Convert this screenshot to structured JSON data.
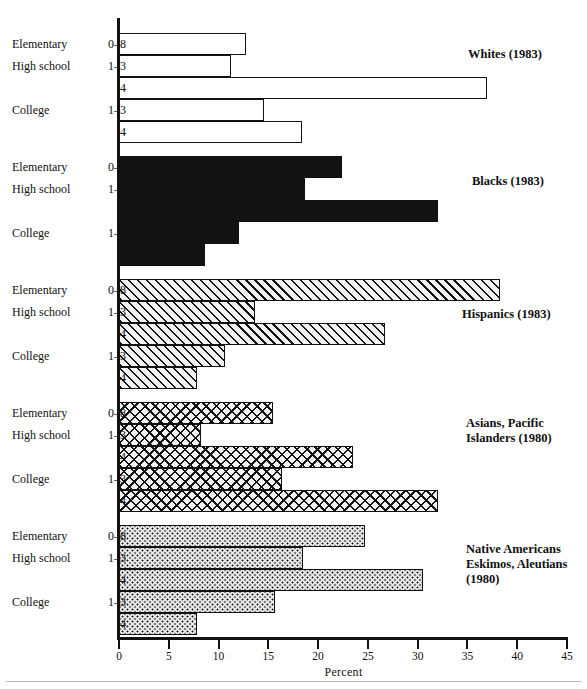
{
  "chart_data": {
    "type": "bar",
    "orientation": "horizontal",
    "title": "",
    "xlabel": "Percent",
    "ylabel": "",
    "xlim": [
      0,
      45
    ],
    "xticks": [
      0,
      5,
      10,
      15,
      20,
      25,
      30,
      35,
      40,
      45
    ],
    "xtick_labels": [
      "0",
      "5",
      "10",
      "15",
      "20",
      "25",
      "30",
      "35",
      "40",
      "45"
    ],
    "grid": false,
    "legend_position": "inside-right",
    "categories": [
      {
        "level": "Elementary",
        "years": "0–8"
      },
      {
        "level": "High school",
        "years": "1–3"
      },
      {
        "level": "",
        "years": "4"
      },
      {
        "level": "College",
        "years": "1–3"
      },
      {
        "level": "",
        "years": "4"
      }
    ],
    "series": [
      {
        "name": "Whites (1983)",
        "caption_lines": [
          "Whites (1983)"
        ],
        "fill": "open",
        "values": [
          12.8,
          11.2,
          37.0,
          14.6,
          18.4
        ]
      },
      {
        "name": "Blacks (1983)",
        "caption_lines": [
          "Blacks (1983)"
        ],
        "fill": "solid",
        "values": [
          22.4,
          18.7,
          32.0,
          12.1,
          8.6
        ]
      },
      {
        "name": "Hispanics (1983)",
        "caption_lines": [
          "Hispanics (1983)"
        ],
        "fill": "hatch",
        "values": [
          38.3,
          13.7,
          26.7,
          10.6,
          7.8
        ]
      },
      {
        "name": "Asians, Pacific Islanders (1980)",
        "caption_lines": [
          "Asians, Pacific",
          "Islanders (1980)"
        ],
        "fill": "cross",
        "values": [
          15.5,
          8.2,
          23.5,
          16.4,
          32.0
        ]
      },
      {
        "name": "Native Americans Eskimos, Aleutians (1980)",
        "caption_lines": [
          "Native Americans",
          "Eskimos, Aleutians",
          "(1980)"
        ],
        "fill": "dots",
        "values": [
          24.7,
          18.5,
          30.5,
          15.7,
          7.8
        ]
      }
    ],
    "colors": {
      "ink": "#121212",
      "background": "#ffffff",
      "hatch_bg": "#f2f2f2"
    }
  },
  "axis": {
    "x_title": "Percent"
  }
}
